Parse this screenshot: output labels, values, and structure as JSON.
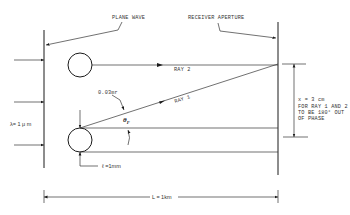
{
  "diagram": {
    "labels": {
      "plane_wave": "PLANE WAVE",
      "receiver_aperture": "RECEIVER APERTURE",
      "ray2": "RAY 2",
      "ray1": "RAY 1",
      "angle_value": "0.03mr",
      "theta": "θ",
      "theta_sub": "F",
      "wavelength": "λ= 1 μ m",
      "diameter": "ℓ =1mm",
      "distance": "L = 1km",
      "separation": "x = 3 cm",
      "note_line1": "FOR RAY 1 AND 2",
      "note_line2": "TO BE 180° OUT",
      "note_line3": "OF PHASE"
    },
    "colors": {
      "line": "#1a1a1a",
      "background": "#ffffff"
    }
  }
}
